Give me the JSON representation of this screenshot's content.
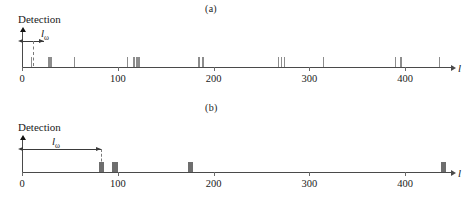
{
  "figure": {
    "axis_variable": "l",
    "y_axis_label": "Detection",
    "window_label": "l",
    "window_subscript": "ω"
  },
  "panels": [
    {
      "id": "a",
      "label": "(a)",
      "y_axis_label": "Detection",
      "window_label_text": "l",
      "window_subscript": "ω",
      "window_start": 0,
      "window_end": 12,
      "axis_variable": "l",
      "xticks": [
        0,
        100,
        200,
        300,
        400
      ],
      "xtick_labels": [
        "0",
        "100",
        "200",
        "300",
        "400"
      ],
      "xlim": [
        -6,
        465
      ],
      "events": [
        10,
        28,
        30,
        55,
        110,
        117,
        120,
        122,
        185,
        189,
        268,
        271,
        274,
        315,
        390,
        396,
        436
      ]
    },
    {
      "id": "b",
      "label": "(b)",
      "y_axis_label": "Detection",
      "window_label_text": "l",
      "window_subscript": "ω",
      "window_start": 0,
      "window_end": 83,
      "axis_variable": "l",
      "xticks": [
        0,
        100,
        200,
        300,
        400
      ],
      "xtick_labels": [
        "0",
        "100",
        "200",
        "300",
        "400"
      ],
      "xlim": [
        -6,
        465
      ],
      "events": [
        83,
        97,
        176,
        440
      ]
    }
  ],
  "chart_data": {
    "type": "bar",
    "title": "",
    "xlabel": "l",
    "ylabel": "Detection",
    "xlim": [
      0,
      465
    ],
    "grid": false,
    "legend": "none",
    "series": [
      {
        "name": "(a)",
        "xlabel": "l",
        "ylabel": "Detection",
        "window_length": 12,
        "x": [
          10,
          28,
          30,
          55,
          110,
          117,
          120,
          122,
          185,
          189,
          268,
          271,
          274,
          315,
          390,
          396,
          436
        ],
        "values": [
          1,
          1,
          1,
          1,
          1,
          1,
          1,
          1,
          1,
          1,
          1,
          1,
          1,
          1,
          1,
          1,
          1
        ]
      },
      {
        "name": "(b)",
        "xlabel": "l",
        "ylabel": "Detection",
        "window_length": 83,
        "x": [
          83,
          97,
          176,
          440
        ],
        "values": [
          1,
          1,
          1,
          1
        ]
      }
    ]
  }
}
